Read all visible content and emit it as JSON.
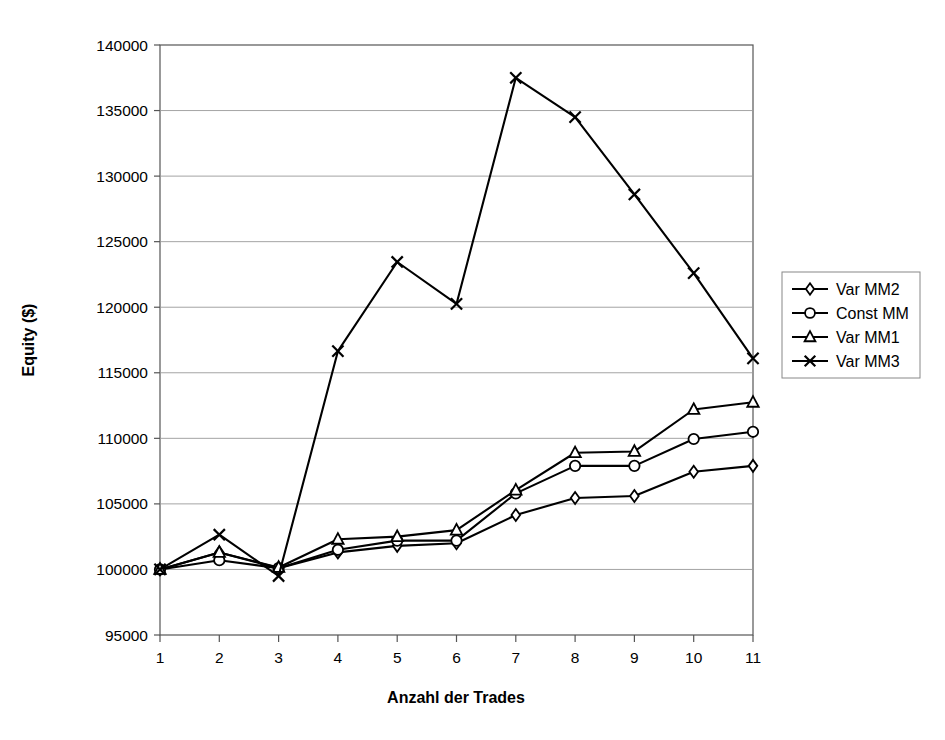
{
  "chart_data": {
    "type": "line",
    "title": "",
    "xlabel": "Anzahl der Trades",
    "ylabel": "Equity ($)",
    "x": [
      1,
      2,
      3,
      4,
      5,
      6,
      7,
      8,
      9,
      10,
      11
    ],
    "xtick_labels": [
      "1",
      "2",
      "3",
      "4",
      "5",
      "6",
      "7",
      "8",
      "9",
      "10",
      "11"
    ],
    "ytick_labels": [
      "95000",
      "100000",
      "105000",
      "110000",
      "115000",
      "120000",
      "125000",
      "130000",
      "135000",
      "140000"
    ],
    "yticks": [
      95000,
      100000,
      105000,
      110000,
      115000,
      120000,
      125000,
      130000,
      135000,
      140000
    ],
    "xlim": [
      1,
      11
    ],
    "ylim": [
      95000,
      140000
    ],
    "grid": "horizontal",
    "legend_position": "right",
    "series": [
      {
        "name": "Var MM2",
        "marker": "diamond",
        "color": "#000000",
        "values": [
          100000,
          101300,
          100100,
          101300,
          101800,
          102000,
          104150,
          105450,
          105600,
          107450,
          107900
        ]
      },
      {
        "name": "Const MM",
        "marker": "circle",
        "color": "#000000",
        "values": [
          100000,
          100700,
          100100,
          101500,
          102200,
          102200,
          105800,
          107900,
          107900,
          109950,
          110500
        ]
      },
      {
        "name": "Var MM1",
        "marker": "triangle",
        "color": "#000000",
        "values": [
          100000,
          101300,
          100150,
          102300,
          102500,
          103000,
          106050,
          108900,
          109000,
          112200,
          112750
        ]
      },
      {
        "name": "Var MM3",
        "marker": "cross",
        "color": "#000000",
        "values": [
          100000,
          102650,
          99500,
          116650,
          123450,
          120250,
          137500,
          134500,
          128600,
          122600,
          116100
        ]
      }
    ]
  },
  "legend": {
    "entries": [
      {
        "label": "Var MM2"
      },
      {
        "label": "Const MM"
      },
      {
        "label": "Var MM1"
      },
      {
        "label": "Var MM3"
      }
    ]
  }
}
